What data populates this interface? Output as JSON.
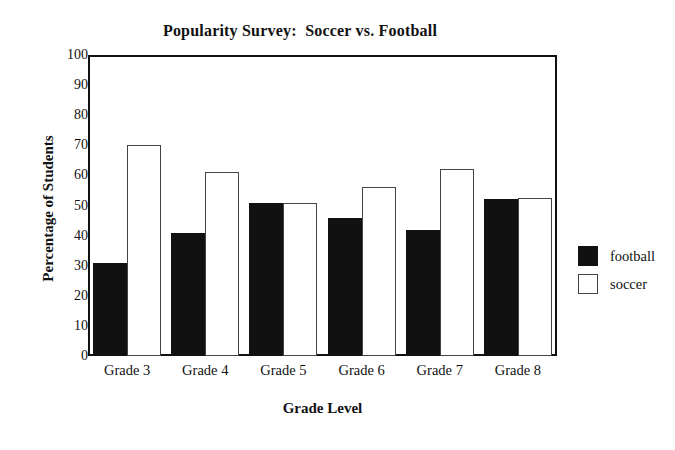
{
  "chart_data": {
    "type": "bar",
    "title": "Popularity Survey:  Soccer vs. Football",
    "xlabel": "Grade Level",
    "ylabel": "Percentage of Students",
    "categories": [
      "Grade 3",
      "Grade 4",
      "Grade 5",
      "Grade 6",
      "Grade 7",
      "Grade 8"
    ],
    "series": [
      {
        "name": "football",
        "color": "#111111",
        "values": [
          31,
          41,
          51,
          46,
          42,
          52
        ]
      },
      {
        "name": "soccer",
        "color": "#ffffff",
        "values": [
          70,
          61,
          51,
          56,
          62,
          52.5
        ]
      }
    ],
    "ylim": [
      0,
      100
    ],
    "yticks": [
      0,
      10,
      20,
      30,
      40,
      50,
      60,
      70,
      80,
      90,
      100
    ],
    "ytick_labels": [
      "0",
      "10",
      "20",
      "30",
      "40",
      "50",
      "60",
      "70",
      "80",
      "90",
      "100"
    ],
    "grid": false,
    "legend_position": "right",
    "legend": [
      {
        "label": "football",
        "swatch": "filled-black-square"
      },
      {
        "label": "soccer",
        "swatch": "outlined-white-square"
      }
    ]
  }
}
